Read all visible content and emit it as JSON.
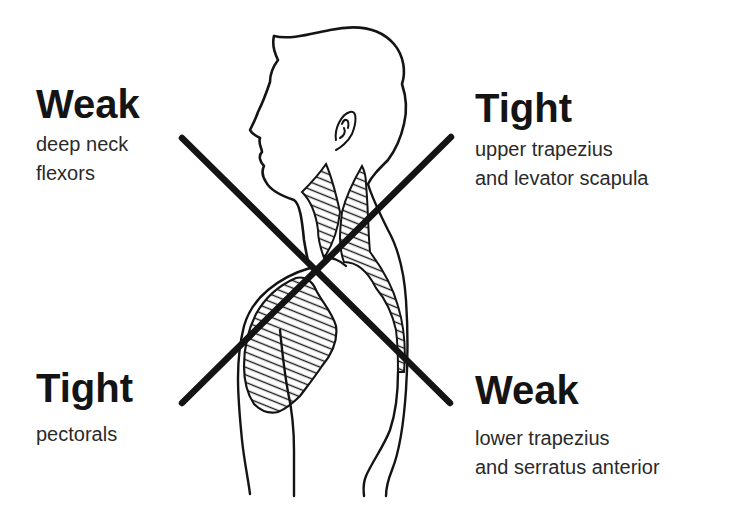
{
  "diagram": {
    "type": "upper-crossed-syndrome",
    "quadrants": {
      "top_left": {
        "heading": "Weak",
        "lines": [
          "deep neck",
          "flexors"
        ]
      },
      "top_right": {
        "heading": "Tight",
        "lines": [
          "upper trapezius",
          "and levator scapula"
        ]
      },
      "bottom_left": {
        "heading": "Tight",
        "lines": [
          "pectorals"
        ]
      },
      "bottom_right": {
        "heading": "Weak",
        "lines": [
          "lower trapezius",
          "and serratus anterior"
        ]
      }
    },
    "colors": {
      "ink": "#141414",
      "background": "#ffffff"
    }
  }
}
